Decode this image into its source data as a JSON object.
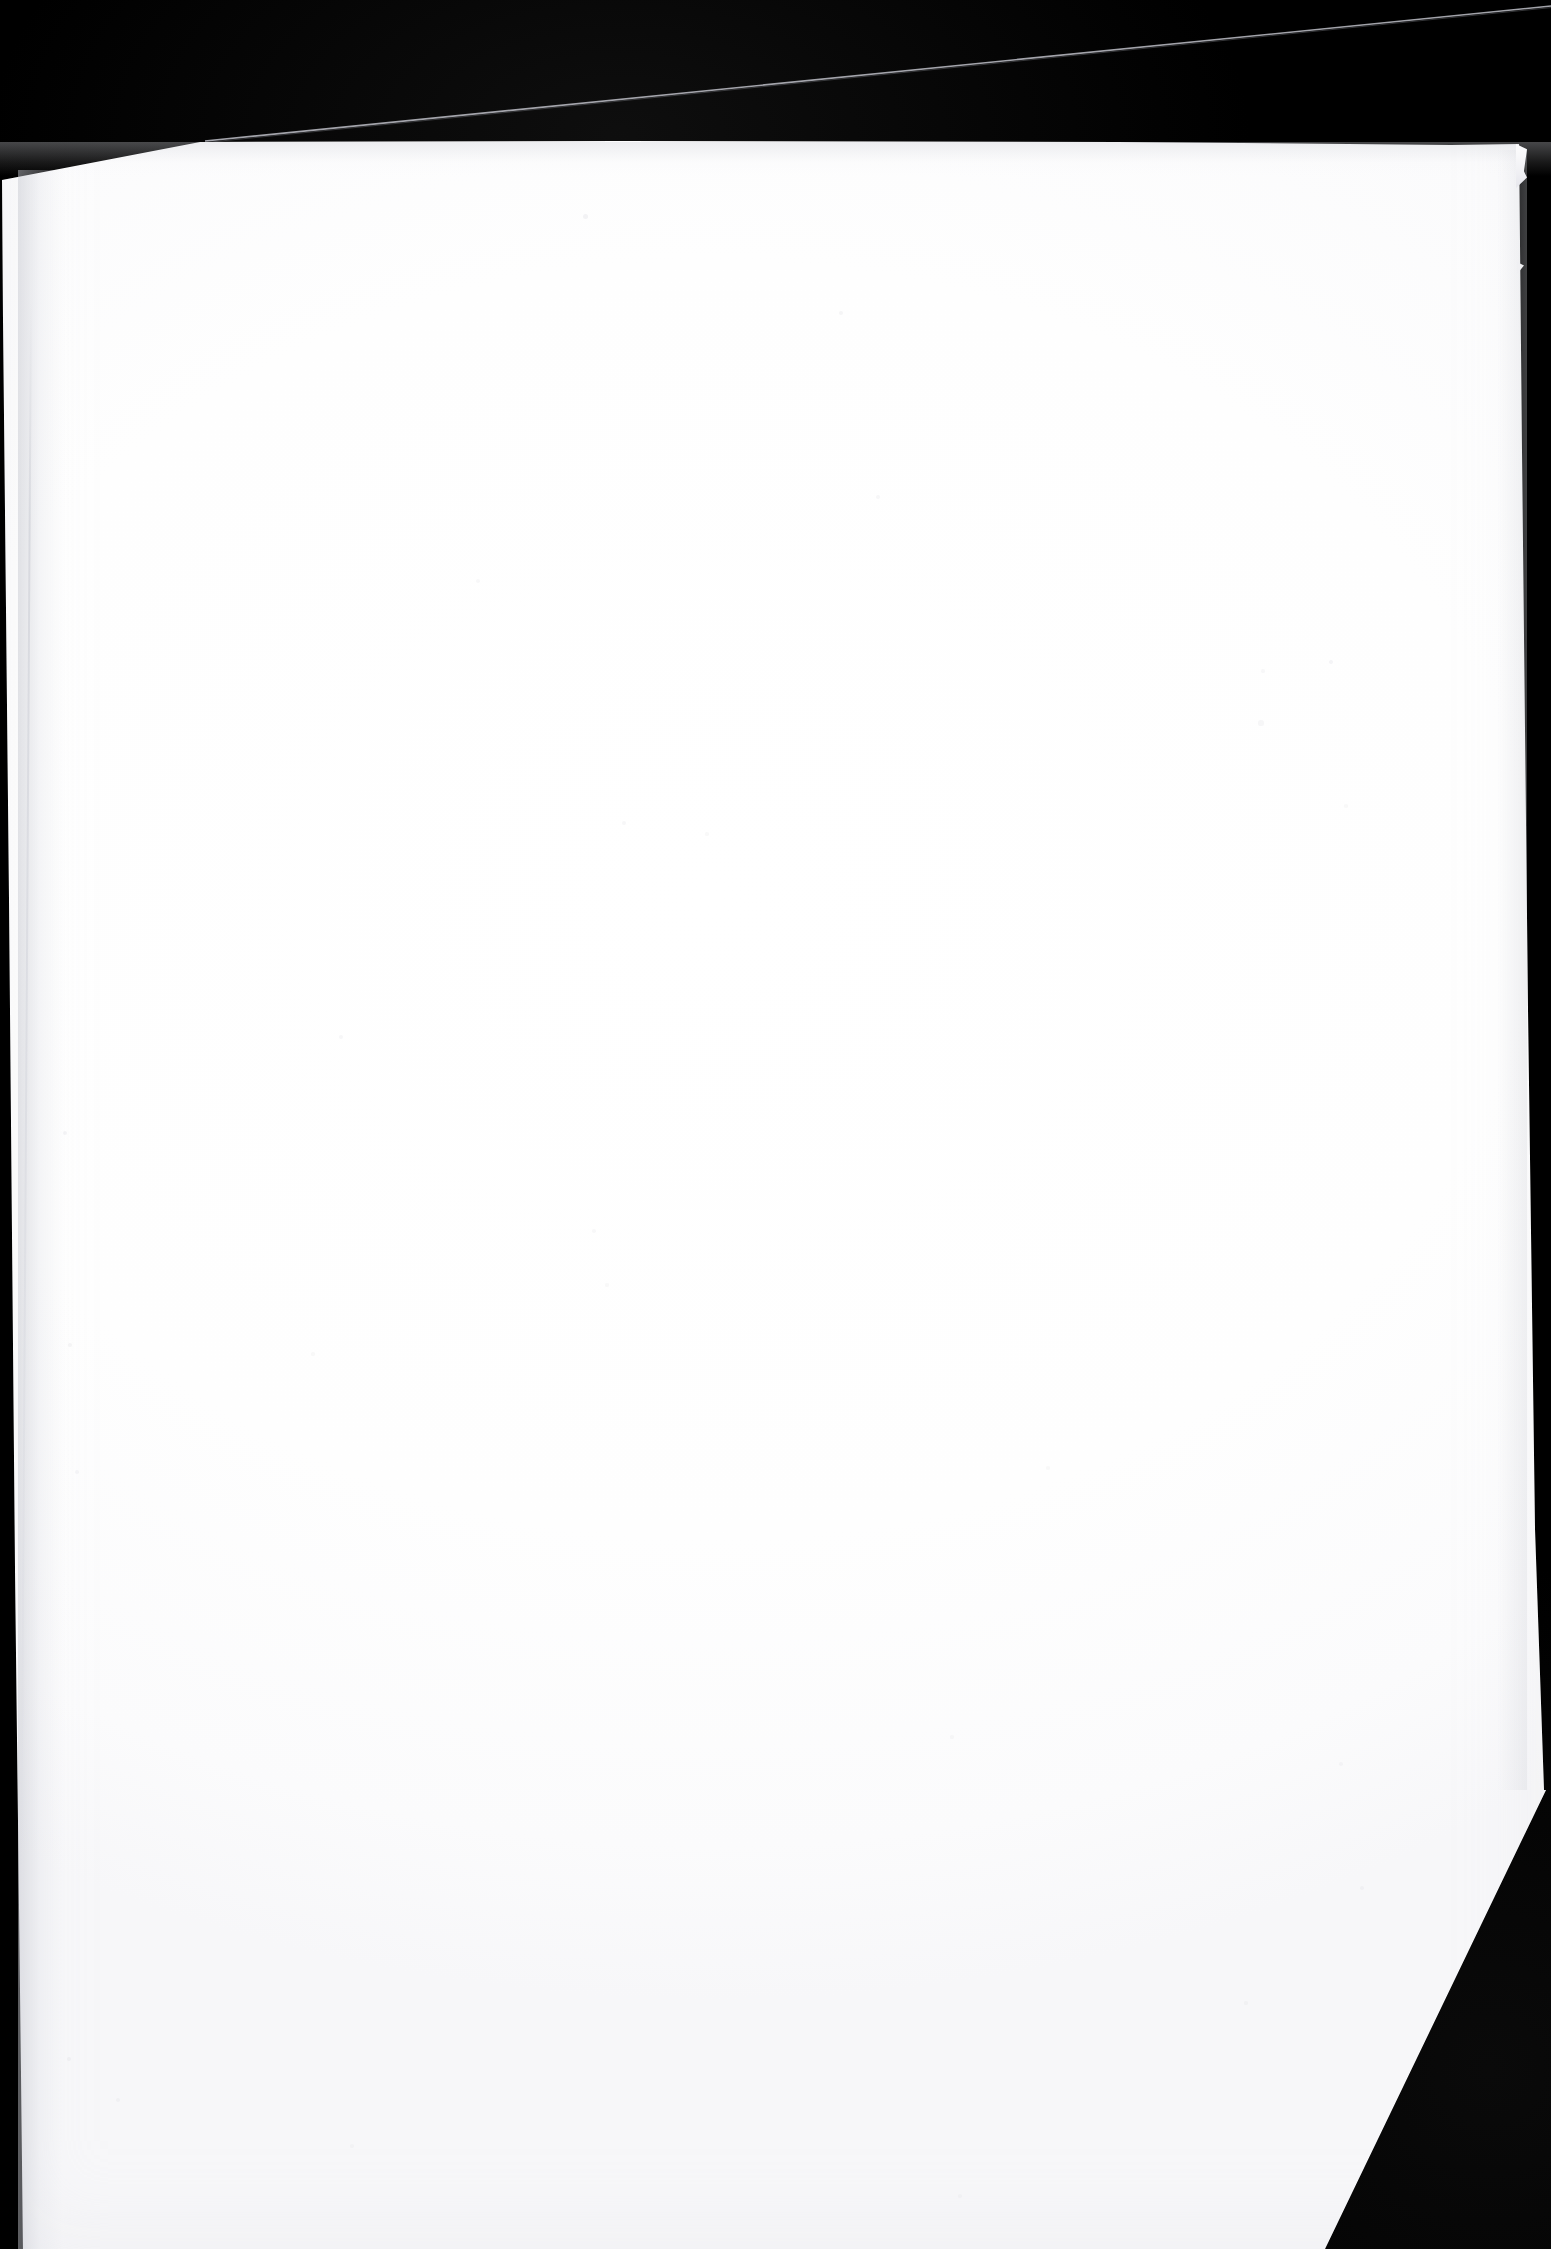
{
  "document": {
    "kind": "scanned-page",
    "description": "Blank scanned document page on black background",
    "page_text": "",
    "visible_text_lines": [],
    "orientation": "portrait"
  },
  "colors": {
    "backdrop": "#000000",
    "paper": "#ffffff",
    "paper_shadow": "#e6e6ec",
    "crease_shadow": "#c4c6ce",
    "hairline": "#b9bac2"
  },
  "geometry": {
    "canvas_width": 1551,
    "canvas_height": 2249,
    "page_top_edge_y": 142,
    "page_left_edge_x": 2,
    "page_right_edge_x": 1520,
    "corner_cut_start": "1546,1790",
    "corner_cut_end": "1325,2249",
    "bottom_runs_off_frame": "true"
  },
  "features": {
    "back_sheet_hairline": {
      "name": "back-sheet-hairline",
      "from_x": 205,
      "from_y": 140,
      "to_x": 1551,
      "to_y": 8
    },
    "corner_cut": {
      "name": "bottom-right-corner-cut",
      "label": "diagonal corner cut"
    },
    "left_crease": {
      "name": "left-edge-crease",
      "label": "vertical crease shadow"
    },
    "top_right_notch": {
      "name": "top-right-torn-sliver",
      "label": "torn paper sliver"
    }
  },
  "specks": [
    {
      "x": 585,
      "y": 216,
      "r": 2.5,
      "o": 0.3
    },
    {
      "x": 841,
      "y": 313,
      "r": 2.0,
      "o": 0.26
    },
    {
      "x": 878,
      "y": 497,
      "r": 2.2,
      "o": 0.24
    },
    {
      "x": 1331,
      "y": 662,
      "r": 2.0,
      "o": 0.28
    },
    {
      "x": 1263,
      "y": 671,
      "r": 1.6,
      "o": 0.2
    },
    {
      "x": 1261,
      "y": 723,
      "r": 2.6,
      "o": 0.22
    },
    {
      "x": 1346,
      "y": 806,
      "r": 1.8,
      "o": 0.18
    },
    {
      "x": 478,
      "y": 581,
      "r": 1.8,
      "o": 0.2
    },
    {
      "x": 624,
      "y": 823,
      "r": 2.0,
      "o": 0.22
    },
    {
      "x": 707,
      "y": 834,
      "r": 1.6,
      "o": 0.18
    },
    {
      "x": 594,
      "y": 1231,
      "r": 1.8,
      "o": 0.2
    },
    {
      "x": 607,
      "y": 1285,
      "r": 1.6,
      "o": 0.18
    },
    {
      "x": 341,
      "y": 1037,
      "r": 2.0,
      "o": 0.22
    },
    {
      "x": 65,
      "y": 1133,
      "r": 2.2,
      "o": 0.3
    },
    {
      "x": 70,
      "y": 1345,
      "r": 2.0,
      "o": 0.26
    },
    {
      "x": 77,
      "y": 1472,
      "r": 1.8,
      "o": 0.24
    },
    {
      "x": 313,
      "y": 1354,
      "r": 1.6,
      "o": 0.18
    },
    {
      "x": 1048,
      "y": 1468,
      "r": 1.8,
      "o": 0.18
    },
    {
      "x": 952,
      "y": 1737,
      "r": 1.6,
      "o": 0.18
    },
    {
      "x": 1341,
      "y": 1764,
      "r": 1.8,
      "o": 0.2
    },
    {
      "x": 1362,
      "y": 1888,
      "r": 1.8,
      "o": 0.2
    },
    {
      "x": 1246,
      "y": 2003,
      "r": 1.6,
      "o": 0.18
    },
    {
      "x": 69,
      "y": 2059,
      "r": 2.0,
      "o": 0.24
    },
    {
      "x": 118,
      "y": 2100,
      "r": 1.8,
      "o": 0.2
    },
    {
      "x": 352,
      "y": 2146,
      "r": 1.6,
      "o": 0.16
    },
    {
      "x": 960,
      "y": 2196,
      "r": 1.6,
      "o": 0.16
    }
  ]
}
